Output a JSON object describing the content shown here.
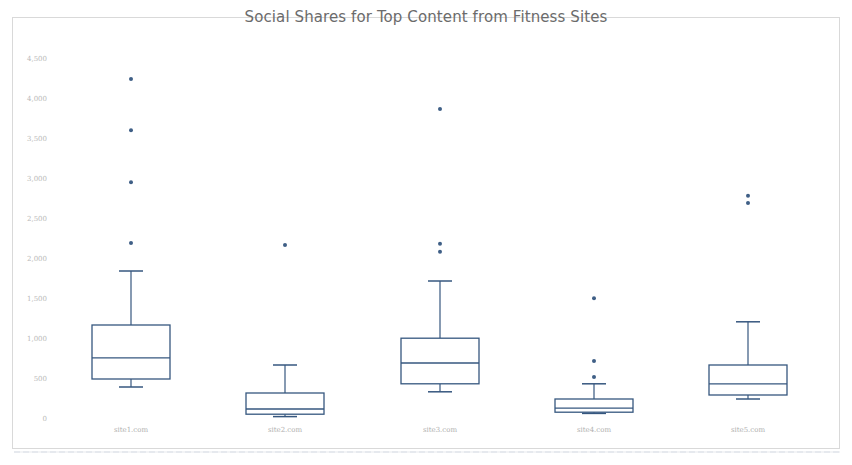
{
  "chart_data": {
    "type": "boxplot",
    "title": "Social Shares for Top Content from Fitness Sites",
    "xlabel": "",
    "ylabel": "",
    "ylim": [
      0,
      4500
    ],
    "y_ticks": [
      "0",
      "500",
      "1,000",
      "1,500",
      "2,000",
      "2,500",
      "3,000",
      "3,500",
      "4,000",
      "4,500"
    ],
    "y_tick_values": [
      0,
      500,
      1000,
      1500,
      2000,
      2500,
      3000,
      3500,
      4000,
      4500
    ],
    "grid": false,
    "legend": null,
    "categories": [
      "site1.com",
      "site2.com",
      "site3.com",
      "site4.com",
      "site5.com"
    ],
    "series": [
      {
        "name": "site1.com",
        "whisker_low": 400,
        "q1": 500,
        "median": 765,
        "q3": 1175,
        "whisker_high": 1850,
        "outliers": [
          2200,
          2960,
          3610,
          4250
        ]
      },
      {
        "name": "site2.com",
        "whisker_low": 30,
        "q1": 60,
        "median": 125,
        "q3": 325,
        "whisker_high": 675,
        "outliers": [
          2175
        ]
      },
      {
        "name": "site3.com",
        "whisker_low": 340,
        "q1": 440,
        "median": 700,
        "q3": 1010,
        "whisker_high": 1725,
        "outliers": [
          2090,
          2190,
          3875
        ]
      },
      {
        "name": "site4.com",
        "whisker_low": 70,
        "q1": 85,
        "median": 135,
        "q3": 250,
        "whisker_high": 440,
        "outliers": [
          525,
          725,
          1510
        ]
      },
      {
        "name": "site5.com",
        "whisker_low": 250,
        "q1": 300,
        "median": 440,
        "q3": 675,
        "whisker_high": 1215,
        "outliers": [
          2700,
          2790
        ]
      }
    ],
    "colors": {
      "stroke": "#36577f",
      "outlier": "#3f5f86",
      "tick_text": "#b9b9b9",
      "title_text": "#6b6b6b",
      "frame": "#d9d9d9"
    }
  }
}
